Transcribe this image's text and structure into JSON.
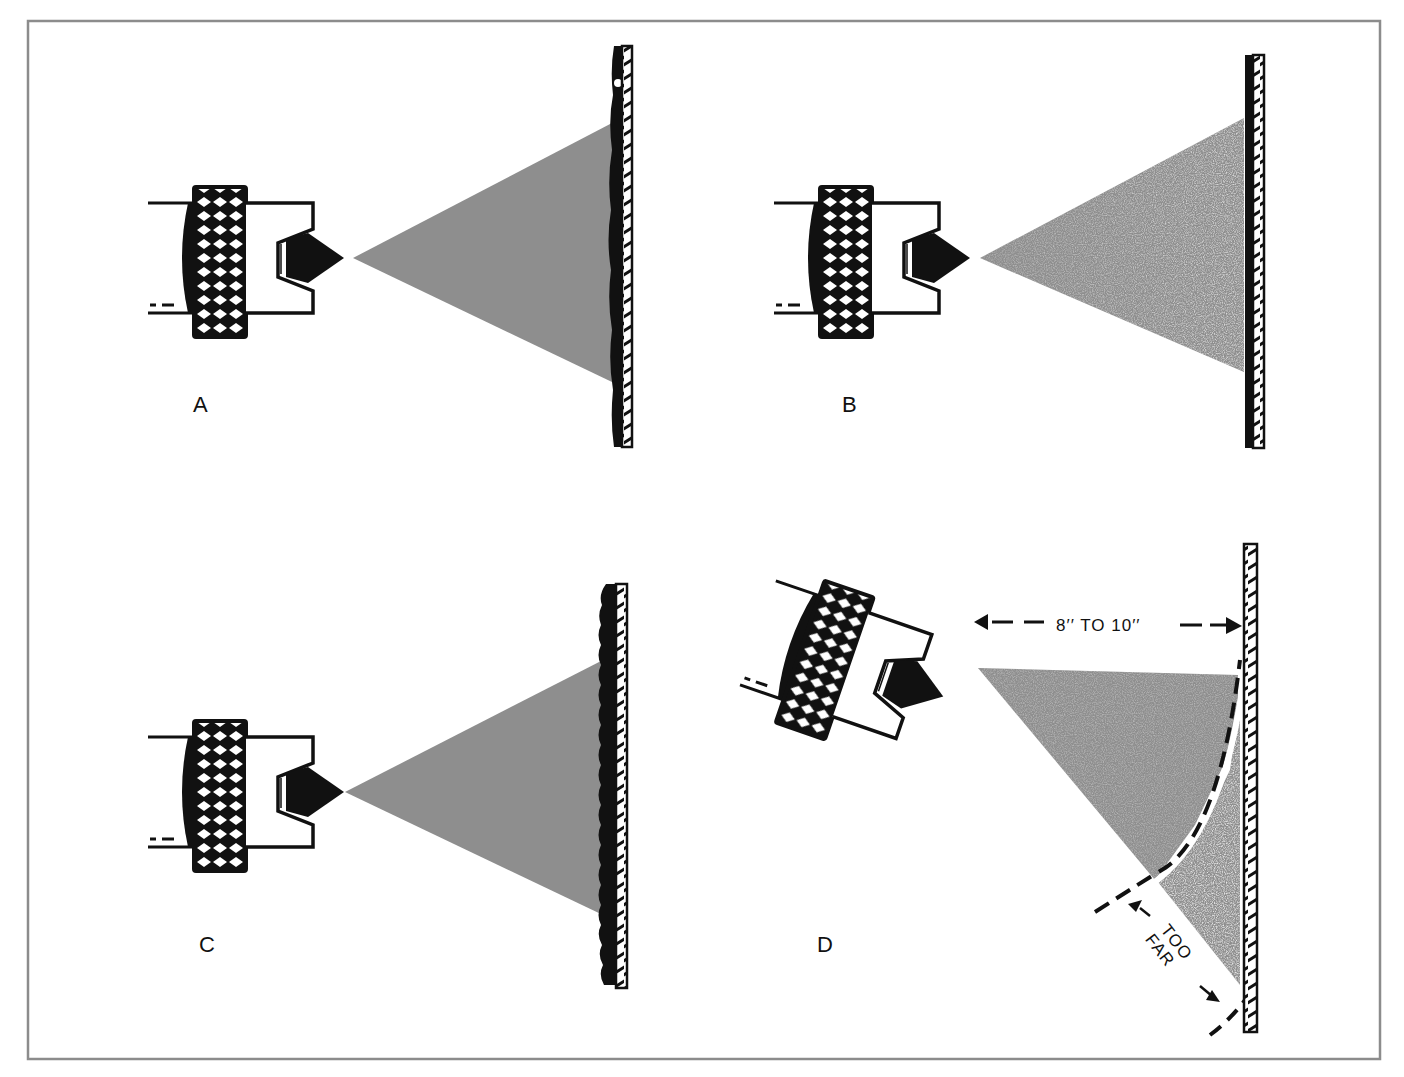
{
  "figure": {
    "frame_color": "#8c8c8c",
    "spray_color": "#8e8e8e",
    "ink_color": "#111111",
    "panels": [
      {
        "id": "A",
        "label": "A",
        "description": "Spray gun too close / heavy coat: paint sags and runs on wall"
      },
      {
        "id": "B",
        "label": "B",
        "description": "Correct distance: even coat on wall"
      },
      {
        "id": "C",
        "label": "C",
        "description": "Uneven / rough coat on wall"
      },
      {
        "id": "D",
        "label": "D",
        "description": "Gun tilted: distance varies, part of spray too far"
      }
    ],
    "annotations": {
      "distance": "8′′ TO 10′′",
      "too_far_line1": "TOO",
      "too_far_line2": "FAR"
    }
  }
}
